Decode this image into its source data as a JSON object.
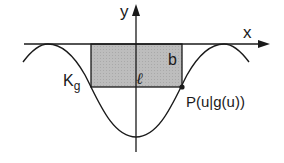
{
  "diagram": {
    "axes": {
      "x_label": "x",
      "y_label": "y"
    },
    "curve_label_main": "K",
    "curve_label_sub": "g",
    "rectangle": {
      "width_label": "ℓ",
      "height_label": "b",
      "fill_color": "#b4b4b4"
    },
    "point_label": "P(u|g(u))",
    "line_color": "#1a1a1a"
  }
}
